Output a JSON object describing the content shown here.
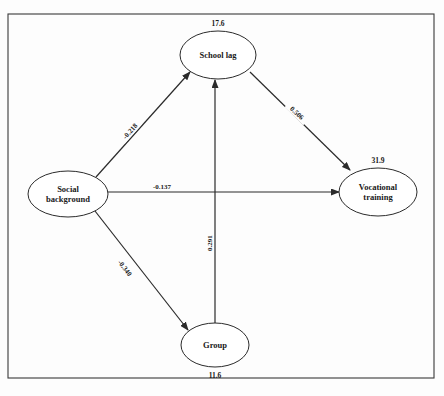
{
  "diagram": {
    "type": "path-diagram",
    "title": "",
    "frame": {
      "x": 8,
      "y": 14,
      "width": 426,
      "height": 364
    },
    "colors": {
      "stroke": "#2b2b2b",
      "fill": "#ffffff",
      "frame": "#3a3a3a"
    },
    "nodes": [
      {
        "id": "school_lag",
        "label": "School lag",
        "label_lines": [
          "School lag"
        ],
        "cx": 218,
        "cy": 55,
        "rx": 38,
        "ry": 24,
        "variance": "17.6",
        "variance_position": "above"
      },
      {
        "id": "social_background",
        "label": "Social background",
        "label_lines": [
          "Social",
          "background"
        ],
        "cx": 68,
        "cy": 194,
        "rx": 40,
        "ry": 23,
        "variance": "",
        "variance_position": "none"
      },
      {
        "id": "vocational_training",
        "label": "Vocational training",
        "label_lines": [
          "Vocational",
          "training"
        ],
        "cx": 378,
        "cy": 192,
        "rx": 39,
        "ry": 24,
        "variance": "31.9",
        "variance_position": "above"
      },
      {
        "id": "group",
        "label": "Group",
        "label_lines": [
          "Group"
        ],
        "cx": 215,
        "cy": 345,
        "rx": 34,
        "ry": 22,
        "variance": "11.6",
        "variance_position": "below"
      }
    ],
    "edges": [
      {
        "id": "sb_to_sl",
        "from": "social_background",
        "to": "school_lag",
        "coefficient": "-0.218",
        "x1": 96,
        "y1": 177,
        "x2": 190,
        "y2": 72,
        "label_x": 130,
        "label_y": 131,
        "label_rotation": -48
      },
      {
        "id": "sb_to_vt",
        "from": "social_background",
        "to": "vocational_training",
        "coefficient": "-0.137",
        "x1": 108,
        "y1": 192,
        "x2": 339,
        "y2": 192,
        "label_x": 162,
        "label_y": 186,
        "label_rotation": 0
      },
      {
        "id": "sb_to_gr",
        "from": "social_background",
        "to": "group",
        "coefficient": "-0.340",
        "x1": 95,
        "y1": 211,
        "x2": 188,
        "y2": 330,
        "label_x": 125,
        "label_y": 268,
        "label_rotation": 52
      },
      {
        "id": "sl_to_vt",
        "from": "school_lag",
        "to": "vocational_training",
        "coefficient": "0.506",
        "x1": 250,
        "y1": 72,
        "x2": 350,
        "y2": 170,
        "label_x": 297,
        "label_y": 113,
        "label_rotation": 44
      },
      {
        "id": "gr_to_sl",
        "from": "group",
        "to": "school_lag",
        "coefficient": "0.291",
        "x1": 215,
        "y1": 323,
        "x2": 215,
        "y2": 80,
        "label_x": 209,
        "label_y": 243,
        "label_rotation": -90
      }
    ]
  }
}
